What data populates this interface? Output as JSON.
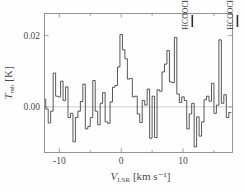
{
  "figure": {
    "kind": "spectrum-plot",
    "background_color": "#fefefe",
    "frame_color": "#8a8a8a",
    "trace_color": "#3a3a3a",
    "zero_line_color": "#b9b9b9"
  },
  "chart_data": {
    "type": "line",
    "title": "",
    "subtitle": "",
    "xlabel": "V_LSR [km s⁻¹]",
    "xlabel_parts": {
      "symbol": "V",
      "subscript": "LSR",
      "unit": "[km s⁻¹]"
    },
    "ylabel": "T_mb [K]",
    "ylabel_parts": {
      "symbol": "T",
      "subscript": "mb",
      "unit": "[K]"
    },
    "xlim": [
      -12.4,
      18.0
    ],
    "ylim": [
      -0.0128,
      0.0262
    ],
    "xticks": [
      -10,
      0,
      10
    ],
    "xticklabels": [
      "-10",
      "0",
      "10"
    ],
    "xminorticks": [
      -5,
      5,
      15
    ],
    "yticks": [
      0.0,
      0.02
    ],
    "yticklabels": [
      "0.00",
      "0.02"
    ],
    "grid": false,
    "legend": false,
    "legend_position": "none",
    "drawstyle": "steps",
    "zero_line": 0.0,
    "annotations": [
      {
        "label": "HCOOCH₃ A",
        "text_main": "HCOOCH",
        "text_sub": "3",
        "text_state": "A",
        "x": 11.5,
        "rotation": -90,
        "marker": true
      },
      {
        "label": "HCOOCH₃ E",
        "text_main": "HCOOCH",
        "text_sub": "3",
        "text_state": "E",
        "x": 18.8,
        "rotation": -90,
        "marker": true
      }
    ],
    "x": [
      -12.4,
      -12.0,
      -11.6,
      -11.2,
      -10.8,
      -10.4,
      -10.0,
      -9.6,
      -9.2,
      -8.8,
      -8.4,
      -8.0,
      -7.6,
      -7.2,
      -6.8,
      -6.4,
      -6.0,
      -5.6,
      -5.2,
      -4.8,
      -4.4,
      -4.0,
      -3.6,
      -3.2,
      -2.8,
      -2.4,
      -2.0,
      -1.6,
      -1.2,
      -0.8,
      -0.4,
      0.0,
      0.4,
      0.8,
      1.2,
      1.6,
      2.0,
      2.4,
      2.8,
      3.2,
      3.6,
      4.0,
      4.4,
      4.8,
      5.2,
      5.6,
      6.0,
      6.4,
      6.8,
      7.2,
      7.6,
      8.0,
      8.4,
      8.8,
      9.2,
      9.6,
      10.0,
      10.4,
      10.8,
      11.2,
      11.6,
      12.0,
      12.4,
      12.8,
      13.2,
      13.6,
      14.0,
      14.4,
      14.8,
      15.2,
      15.6,
      16.0,
      16.4,
      16.8,
      17.2,
      17.6
    ],
    "values": [
      0.0022,
      -0.0006,
      -0.0045,
      -0.0012,
      0.0095,
      0.003,
      0.0028,
      0.0072,
      0.0018,
      0.0056,
      -0.003,
      -0.0018,
      -0.0098,
      -0.003,
      -0.0012,
      0.0015,
      0.0064,
      -0.0062,
      -0.0055,
      -0.003,
      0.0074,
      -0.0012,
      -0.005,
      0.001,
      0.004,
      -0.0042,
      -0.0046,
      0.0014,
      0.0055,
      0.006,
      0.0112,
      0.0203,
      0.016,
      0.0135,
      0.0078,
      0.008,
      0.0028,
      0.003,
      -0.002,
      -0.0044,
      0.0018,
      0.0005,
      0.005,
      -0.0088,
      0.003,
      -0.0086,
      0.0048,
      0.0044,
      0.0098,
      0.012,
      0.0158,
      0.007,
      0.0068,
      0.0195,
      0.0036,
      0.0012,
      0.0028,
      0.0018,
      -0.0062,
      -0.002,
      0.001,
      -0.0112,
      -0.0028,
      -0.0082,
      -0.0042,
      0.002,
      0.003,
      0.0016,
      0.0066,
      -0.0018,
      0.0005,
      0.0188,
      0.001,
      0.0034,
      -0.003,
      -0.0016
    ]
  }
}
